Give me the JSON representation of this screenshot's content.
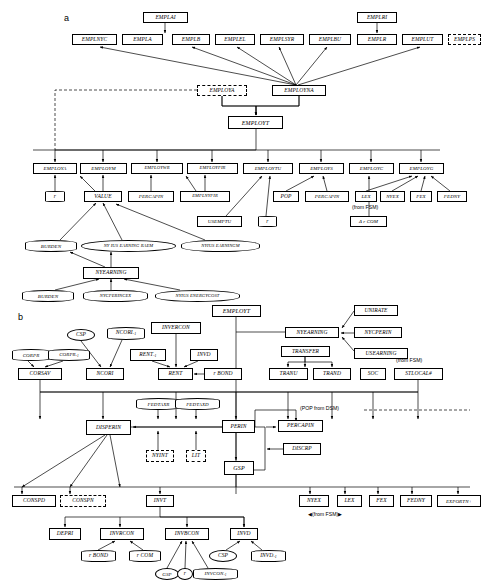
{
  "figure": {
    "panel_a": {
      "letter": "a",
      "nodes": [
        {
          "id": "EMPLAI",
          "label": "EMPLAI",
          "shape": "rect",
          "x": 143,
          "y": 12,
          "w": 45,
          "h": 11
        },
        {
          "id": "EMPLNYC",
          "label": "EMPLNYC",
          "shape": "rect",
          "x": 72,
          "y": 34,
          "w": 45,
          "h": 11
        },
        {
          "id": "EMPLA",
          "label": "EMPLA",
          "shape": "rect",
          "x": 122,
          "y": 34,
          "w": 41,
          "h": 11
        },
        {
          "id": "EMPLB",
          "label": "EMPLB",
          "shape": "rect",
          "x": 172,
          "y": 34,
          "w": 38,
          "h": 11
        },
        {
          "id": "EMPLEL",
          "label": "EMPLEL",
          "shape": "rect",
          "x": 215,
          "y": 34,
          "w": 40,
          "h": 11
        },
        {
          "id": "EMPLSYR",
          "label": "EMPLSYR",
          "shape": "rect",
          "x": 260,
          "y": 34,
          "w": 44,
          "h": 11
        },
        {
          "id": "EMPLBU",
          "label": "EMPLBU",
          "shape": "rect",
          "x": 309,
          "y": 34,
          "w": 42,
          "h": 11
        },
        {
          "id": "EMPLRI",
          "label": "EMPLRI",
          "shape": "rect",
          "x": 357,
          "y": 12,
          "w": 40,
          "h": 11
        },
        {
          "id": "EMPLR",
          "label": "EMPLR",
          "shape": "rect",
          "x": 357,
          "y": 34,
          "w": 40,
          "h": 11
        },
        {
          "id": "EMPLUT",
          "label": "EMPLUT",
          "shape": "rect",
          "x": 402,
          "y": 34,
          "w": 41,
          "h": 11
        },
        {
          "id": "EMPLPS",
          "label": "EMPLPS",
          "shape": "rect-dashed",
          "x": 448,
          "y": 34,
          "w": 33,
          "h": 11
        },
        {
          "id": "EMPLOYA",
          "label": "EMPLOYA",
          "shape": "rect-dashed",
          "x": 197,
          "y": 85,
          "w": 50,
          "h": 11
        },
        {
          "id": "EMPLOYNA",
          "label": "EMPLOYNA",
          "shape": "rect",
          "x": 272,
          "y": 85,
          "w": 54,
          "h": 11
        },
        {
          "id": "EMPLOYT",
          "label": "EMPLOYT",
          "shape": "rect",
          "x": 228,
          "y": 116,
          "w": 55,
          "h": 13
        },
        {
          "id": "EMPLOYA2",
          "label": "EMPLOYA",
          "shape": "rect",
          "x": 33,
          "y": 163,
          "w": 44,
          "h": 11
        },
        {
          "id": "EMPLOYM",
          "label": "EMPLOYM",
          "shape": "rect",
          "x": 80,
          "y": 163,
          "w": 47,
          "h": 11
        },
        {
          "id": "EMPLOYWR",
          "label": "EMPLOYWR",
          "shape": "rect",
          "x": 131,
          "y": 163,
          "w": 52,
          "h": 11
        },
        {
          "id": "EMPLOYFIR",
          "label": "EMPLOYFIR",
          "shape": "rect",
          "x": 187,
          "y": 163,
          "w": 51,
          "h": 11
        },
        {
          "id": "EMPLOYTU",
          "label": "EMPLOYTU",
          "shape": "rect",
          "x": 243,
          "y": 163,
          "w": 50,
          "h": 11
        },
        {
          "id": "EMPLOYS",
          "label": "EMPLOYS",
          "shape": "rect",
          "x": 299,
          "y": 163,
          "w": 45,
          "h": 11
        },
        {
          "id": "EMPLOYC",
          "label": "EMPLOYC",
          "shape": "rect",
          "x": 349,
          "y": 163,
          "w": 45,
          "h": 11
        },
        {
          "id": "EMPLOYG",
          "label": "EMPLOYG",
          "shape": "rect",
          "x": 399,
          "y": 163,
          "w": 45,
          "h": 11
        },
        {
          "id": "r1",
          "label": "r",
          "shape": "ellipse",
          "x": 45,
          "y": 191,
          "w": 20,
          "h": 11
        },
        {
          "id": "VALUE",
          "label": "VALUE",
          "shape": "rect",
          "x": 84,
          "y": 191,
          "w": 38,
          "h": 11
        },
        {
          "id": "PERCAPIN1",
          "label": "PERCAPIN",
          "shape": "rect",
          "x": 128,
          "y": 191,
          "w": 46,
          "h": 11
        },
        {
          "id": "EMPLNYFIR",
          "label": "EMPLNYFIR",
          "shape": "rect",
          "x": 180,
          "y": 191,
          "w": 50,
          "h": 11
        },
        {
          "id": "POP",
          "label": "POP",
          "shape": "rect",
          "x": 273,
          "y": 191,
          "w": 26,
          "h": 11
        },
        {
          "id": "PERCAPIN2",
          "label": "PERCAPIN",
          "shape": "rect",
          "x": 305,
          "y": 191,
          "w": 44,
          "h": 11
        },
        {
          "id": "LEX1",
          "label": "LEX",
          "shape": "rect",
          "x": 355,
          "y": 191,
          "w": 22,
          "h": 11
        },
        {
          "id": "NYEX1",
          "label": "NYEX",
          "shape": "rect",
          "x": 380,
          "y": 191,
          "w": 25,
          "h": 11
        },
        {
          "id": "FEX1",
          "label": "FEX",
          "shape": "rect",
          "x": 410,
          "y": 191,
          "w": 22,
          "h": 11
        },
        {
          "id": "FEDNY1",
          "label": "FEDNY",
          "shape": "rect",
          "x": 437,
          "y": 191,
          "w": 30,
          "h": 11
        },
        {
          "id": "USEMPTU",
          "label": "USEMPTU",
          "shape": "rect",
          "x": 197,
          "y": 216,
          "w": 45,
          "h": 11
        },
        {
          "id": "r2",
          "label": "r",
          "shape": "ellipse",
          "x": 258,
          "y": 216,
          "w": 19,
          "h": 11
        },
        {
          "id": "DrCOM",
          "label": "Δ r COM",
          "shape": "rect",
          "x": 350,
          "y": 216,
          "w": 37,
          "h": 11
        },
        {
          "id": "BURDEN1",
          "label": "BURDEN",
          "shape": "ellipse",
          "x": 25,
          "y": 240,
          "w": 52,
          "h": 12
        },
        {
          "id": "NYIUSEARNINGRAEM",
          "label": "NY IUS EARNING RAEM",
          "shape": "ellipse",
          "x": 81,
          "y": 240,
          "w": 95,
          "h": 12
        },
        {
          "id": "NYIUSEARNINGM",
          "label": "NYIUS EARNINGM",
          "shape": "ellipse",
          "x": 181,
          "y": 240,
          "w": 79,
          "h": 12
        },
        {
          "id": "NYEARNING",
          "label": "NYEARNING",
          "shape": "rect",
          "x": 83,
          "y": 267,
          "w": 56,
          "h": 12
        },
        {
          "id": "BURDEN2",
          "label": "BURDEN",
          "shape": "ellipse",
          "x": 22,
          "y": 290,
          "w": 52,
          "h": 12
        },
        {
          "id": "NYCPERINCEX",
          "label": "NYCPERINCEX",
          "shape": "ellipse",
          "x": 83,
          "y": 290,
          "w": 65,
          "h": 12
        },
        {
          "id": "NYIUSENERGYCOST",
          "label": "NYIUS ENERGYCOST",
          "shape": "ellipse",
          "x": 155,
          "y": 290,
          "w": 85,
          "h": 12
        }
      ],
      "annotations": [
        {
          "id": "from-fsm-a",
          "text": "(from FSM)",
          "x": 352,
          "y": 205
        }
      ]
    },
    "panel_b": {
      "letter": "b",
      "nodes": [
        {
          "id": "EMPLOYTb",
          "label": "EMPLOYT",
          "shape": "rect",
          "x": 212,
          "y": 305,
          "w": 49,
          "h": 12
        },
        {
          "id": "UNIRATE",
          "label": "UNIRATE",
          "shape": "rect",
          "x": 354,
          "y": 305,
          "w": 44,
          "h": 11
        },
        {
          "id": "NYEARNINGb",
          "label": "NYEARNING",
          "shape": "rect",
          "x": 285,
          "y": 327,
          "w": 54,
          "h": 11
        },
        {
          "id": "NYCPERIN",
          "label": "NYCPERIN",
          "shape": "rect",
          "x": 354,
          "y": 327,
          "w": 48,
          "h": 11
        },
        {
          "id": "CSPb",
          "label": "CSP",
          "shape": "ellipse",
          "x": 67,
          "y": 329,
          "w": 28,
          "h": 12
        },
        {
          "id": "NCORIsub",
          "label": "NCORI<sub>-1</sub>",
          "shape": "ellipse",
          "x": 107,
          "y": 327,
          "w": 38,
          "h": 13
        },
        {
          "id": "INVERCON",
          "label": "INVERCON",
          "shape": "rect",
          "x": 151,
          "y": 322,
          "w": 50,
          "h": 12
        },
        {
          "id": "TRANSFER",
          "label": "TRANSFER",
          "shape": "rect",
          "x": 281,
          "y": 346,
          "w": 49,
          "h": 11
        },
        {
          "id": "USEARNING",
          "label": "USEARNING",
          "shape": "rect",
          "x": 354,
          "y": 348,
          "w": 54,
          "h": 11
        },
        {
          "id": "CORPR",
          "label": "CORPR",
          "shape": "ellipse",
          "x": 12,
          "y": 349,
          "w": 38,
          "h": 12
        },
        {
          "id": "CORPRsub",
          "label": "CORPR<sub>-1</sub>",
          "shape": "ellipse",
          "x": 48,
          "y": 349,
          "w": 42,
          "h": 12
        },
        {
          "id": "RENTsub",
          "label": "RENT<sub>-1</sub>",
          "shape": "rect",
          "x": 130,
          "y": 349,
          "w": 36,
          "h": 12
        },
        {
          "id": "INVD1",
          "label": "INVD",
          "shape": "rect",
          "x": 190,
          "y": 349,
          "w": 28,
          "h": 12
        },
        {
          "id": "CORSAV",
          "label": "CORSAV",
          "shape": "rect",
          "x": 18,
          "y": 368,
          "w": 44,
          "h": 12
        },
        {
          "id": "NCORI",
          "label": "NCORI",
          "shape": "rect",
          "x": 86,
          "y": 368,
          "w": 38,
          "h": 12
        },
        {
          "id": "RENT",
          "label": "RENT",
          "shape": "rect",
          "x": 158,
          "y": 368,
          "w": 35,
          "h": 12
        },
        {
          "id": "rBOND1",
          "label": "r BOND",
          "shape": "rect",
          "x": 204,
          "y": 368,
          "w": 38,
          "h": 12
        },
        {
          "id": "TRANU",
          "label": "TRANU",
          "shape": "rect",
          "x": 269,
          "y": 368,
          "w": 39,
          "h": 12
        },
        {
          "id": "TRAND",
          "label": "TRAND",
          "shape": "rect",
          "x": 313,
          "y": 368,
          "w": 38,
          "h": 12
        },
        {
          "id": "SOC",
          "label": "SOC",
          "shape": "rect",
          "x": 360,
          "y": 368,
          "w": 26,
          "h": 12
        },
        {
          "id": "STLOCALW",
          "label": "STLOCAL#",
          "shape": "rect",
          "x": 394,
          "y": 368,
          "w": 49,
          "h": 12
        },
        {
          "id": "FEDTAXR",
          "label": "FEDTAXR",
          "shape": "ellipse",
          "x": 136,
          "y": 398,
          "w": 45,
          "h": 12
        },
        {
          "id": "FEDTAXD",
          "label": "FEDTAXD",
          "shape": "ellipse",
          "x": 175,
          "y": 398,
          "w": 45,
          "h": 12
        },
        {
          "id": "DISPERIN",
          "label": "DISPERIN",
          "shape": "rect",
          "x": 86,
          "y": 420,
          "w": 45,
          "h": 15
        },
        {
          "id": "PERIN",
          "label": "PERIN",
          "shape": "rect",
          "x": 222,
          "y": 420,
          "w": 33,
          "h": 13
        },
        {
          "id": "PERCAPINb",
          "label": "PERCAPIN",
          "shape": "rect",
          "x": 278,
          "y": 420,
          "w": 45,
          "h": 12
        },
        {
          "id": "NYINT",
          "label": "NYINT",
          "shape": "rect-dashed",
          "x": 146,
          "y": 450,
          "w": 28,
          "h": 12
        },
        {
          "id": "LIT",
          "label": "LIT",
          "shape": "rect-dashed",
          "x": 186,
          "y": 450,
          "w": 20,
          "h": 12
        },
        {
          "id": "DISCRP",
          "label": "DISCRP",
          "shape": "rect",
          "x": 283,
          "y": 443,
          "w": 38,
          "h": 12
        },
        {
          "id": "GSPb",
          "label": "GSP",
          "shape": "rect",
          "x": 224,
          "y": 461,
          "w": 30,
          "h": 14
        },
        {
          "id": "CONSPD",
          "label": "CONSPD",
          "shape": "rect",
          "x": 12,
          "y": 495,
          "w": 44,
          "h": 12
        },
        {
          "id": "CONSPN",
          "label": "CONSPN",
          "shape": "rect-dashed",
          "x": 60,
          "y": 495,
          "w": 46,
          "h": 12
        },
        {
          "id": "INVT",
          "label": "INVT",
          "shape": "rect",
          "x": 146,
          "y": 495,
          "w": 28,
          "h": 12
        },
        {
          "id": "NYEXb",
          "label": "NYEX",
          "shape": "rect",
          "x": 299,
          "y": 495,
          "w": 30,
          "h": 12
        },
        {
          "id": "LEXb",
          "label": "LEX",
          "shape": "rect",
          "x": 337,
          "y": 495,
          "w": 25,
          "h": 12
        },
        {
          "id": "FEXb",
          "label": "FEX",
          "shape": "rect",
          "x": 369,
          "y": 495,
          "w": 25,
          "h": 12
        },
        {
          "id": "FEDNYb",
          "label": "FEDNY",
          "shape": "rect",
          "x": 400,
          "y": 495,
          "w": 32,
          "h": 12
        },
        {
          "id": "EXPORTNplus",
          "label": "EXPORTN+",
          "shape": "rect",
          "x": 437,
          "y": 495,
          "w": 44,
          "h": 12
        },
        {
          "id": "DEPRI",
          "label": "DEPRI",
          "shape": "rect",
          "x": 49,
          "y": 528,
          "w": 32,
          "h": 12
        },
        {
          "id": "INVRCON",
          "label": "INVRCON",
          "shape": "rect",
          "x": 100,
          "y": 528,
          "w": 44,
          "h": 12
        },
        {
          "id": "INVBCON",
          "label": "INVBCON",
          "shape": "rect",
          "x": 165,
          "y": 528,
          "w": 44,
          "h": 12
        },
        {
          "id": "INVDb",
          "label": "INVD",
          "shape": "rect",
          "x": 230,
          "y": 528,
          "w": 28,
          "h": 12
        },
        {
          "id": "rBOND2",
          "label": "r BOND",
          "shape": "ellipse",
          "x": 81,
          "y": 550,
          "w": 35,
          "h": 12
        },
        {
          "id": "rCOM",
          "label": "r COM",
          "shape": "ellipse",
          "x": 129,
          "y": 550,
          "w": 32,
          "h": 12
        },
        {
          "id": "CSPb2",
          "label": "CSP",
          "shape": "ellipse",
          "x": 209,
          "y": 550,
          "w": 28,
          "h": 12
        },
        {
          "id": "INVDsub",
          "label": "INVD<sub>-1</sub>",
          "shape": "ellipse",
          "x": 251,
          "y": 550,
          "w": 35,
          "h": 12
        },
        {
          "id": "GSPsm",
          "label": "GSP",
          "shape": "ellipse",
          "x": 155,
          "y": 568,
          "w": 24,
          "h": 12
        },
        {
          "id": "rsm",
          "label": "r",
          "shape": "ellipse",
          "x": 177,
          "y": 568,
          "w": 16,
          "h": 12
        },
        {
          "id": "INVCONsub",
          "label": "INVCON<sub>-1</sub>",
          "shape": "ellipse",
          "x": 193,
          "y": 568,
          "w": 45,
          "h": 12
        }
      ],
      "annotations": [
        {
          "id": "from-fsm-b1",
          "text": "(from FSM)",
          "x": 396,
          "y": 357
        },
        {
          "id": "pop-from-dsm",
          "text": "(POP from DSM)",
          "x": 300,
          "y": 406
        },
        {
          "id": "from-fsm-b2",
          "text": "(from FSM)",
          "x": 308,
          "y": 511
        }
      ]
    }
  }
}
